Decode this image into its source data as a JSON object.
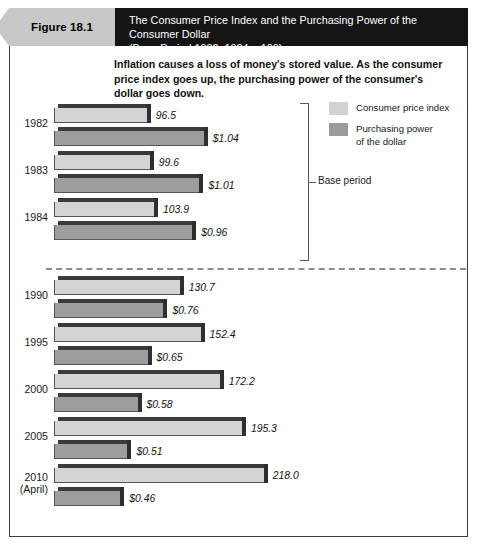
{
  "figure": {
    "tag": "Figure 18.1",
    "title_line1": "The Consumer Price Index and the Purchasing Power of the Consumer Dollar",
    "title_line2": "(Base Period 1982–1984 = 100)"
  },
  "caption": "Inflation causes a loss of money's stored value. As the consumer price index goes up, the purchasing power of the consumer's dollar goes down.",
  "legend": {
    "items": [
      {
        "label": "Consumer price index",
        "color": "#d4d4d4",
        "swatch_name": "legend-swatch-cpi"
      },
      {
        "label": "Purchasing power\nof the dollar",
        "color": "#9d9d9d",
        "swatch_name": "legend-swatch-ppd"
      }
    ],
    "item0_label": "Consumer price index",
    "item1_label_line1": "Purchasing power",
    "item1_label_line2": "of the dollar"
  },
  "annotations": {
    "base_period": "Base period"
  },
  "chart_data": {
    "type": "bar",
    "title": "The Consumer Price Index and the Purchasing Power of the Consumer Dollar",
    "subtitle": "(Base Period 1982–1984 = 100)",
    "orientation": "horizontal",
    "grid": false,
    "legend_position": "top-right",
    "xlabel": "",
    "ylabel": "",
    "categories": [
      "1982",
      "1983",
      "1984",
      "1990",
      "1995",
      "2000",
      "2005",
      "2010 (April)"
    ],
    "category_labels": [
      {
        "line1": "1982",
        "line2": ""
      },
      {
        "line1": "1983",
        "line2": ""
      },
      {
        "line1": "1984",
        "line2": ""
      },
      {
        "line1": "1990",
        "line2": ""
      },
      {
        "line1": "1995",
        "line2": ""
      },
      {
        "line1": "2000",
        "line2": ""
      },
      {
        "line1": "2005",
        "line2": ""
      },
      {
        "line1": "2010",
        "line2": "(April)"
      }
    ],
    "series": [
      {
        "name": "Consumer price index",
        "color": "#d4d4d4",
        "values": [
          96.5,
          99.6,
          103.9,
          130.7,
          152.4,
          172.2,
          195.3,
          218.0
        ],
        "labels": [
          "96.5",
          "99.6",
          "103.9",
          "130.7",
          "152.4",
          "172.2",
          "195.3",
          "218.0"
        ]
      },
      {
        "name": "Purchasing power of the dollar",
        "color": "#9d9d9d",
        "values": [
          1.04,
          1.01,
          0.96,
          0.76,
          0.65,
          0.58,
          0.51,
          0.46
        ],
        "labels": [
          "$1.04",
          "$1.01",
          "$0.96",
          "$0.76",
          "$0.65",
          "$0.58",
          "$0.51",
          "$0.46"
        ]
      }
    ],
    "base_period_years": [
      "1982",
      "1983",
      "1984"
    ],
    "annotation": "Base period",
    "xlim_cpi": [
      0,
      218.0
    ],
    "xlim_ppd": [
      0,
      1.04
    ]
  }
}
